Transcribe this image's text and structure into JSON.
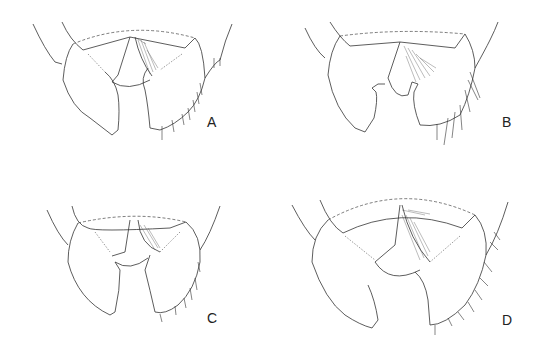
{
  "figure": {
    "panels": [
      {
        "id": "A",
        "label": "A"
      },
      {
        "id": "B",
        "label": "B"
      },
      {
        "id": "C",
        "label": "C"
      },
      {
        "id": "D",
        "label": "D"
      }
    ]
  },
  "colors": {
    "line": "#333333",
    "background": "#ffffff"
  }
}
